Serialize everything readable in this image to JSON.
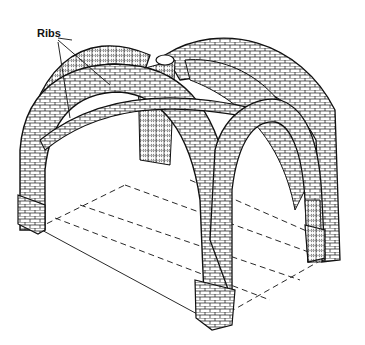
{
  "figure": {
    "labels": [
      {
        "id": "ribs",
        "text": "Ribs",
        "x": 37,
        "y": 34
      }
    ]
  },
  "colors": {
    "background": "#ffffff",
    "ink": "#111111",
    "hatch": "#bdbdbd"
  }
}
